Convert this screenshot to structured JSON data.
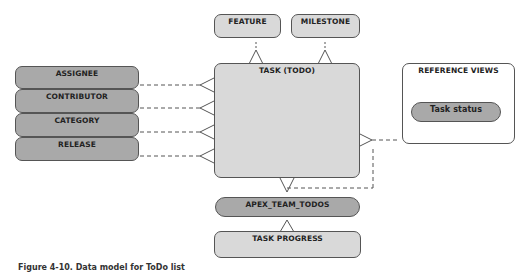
{
  "diagram": {
    "entities": {
      "feature": "FEATURE",
      "milestone": "MILESTONE",
      "task": "TASK (TODO)",
      "assignee": "ASSIGNEE",
      "contributor": "CONTRIBUTOR",
      "category": "CATEGORY",
      "release": "RELEASE",
      "apex_team_todos": "APEX_TEAM_TODOS",
      "task_progress": "TASK PROGRESS"
    },
    "reference_views": {
      "title": "REFERENCE VIEWS",
      "items": [
        "Task status"
      ]
    },
    "caption": "Figure 4-10. Data model for ToDo list"
  }
}
